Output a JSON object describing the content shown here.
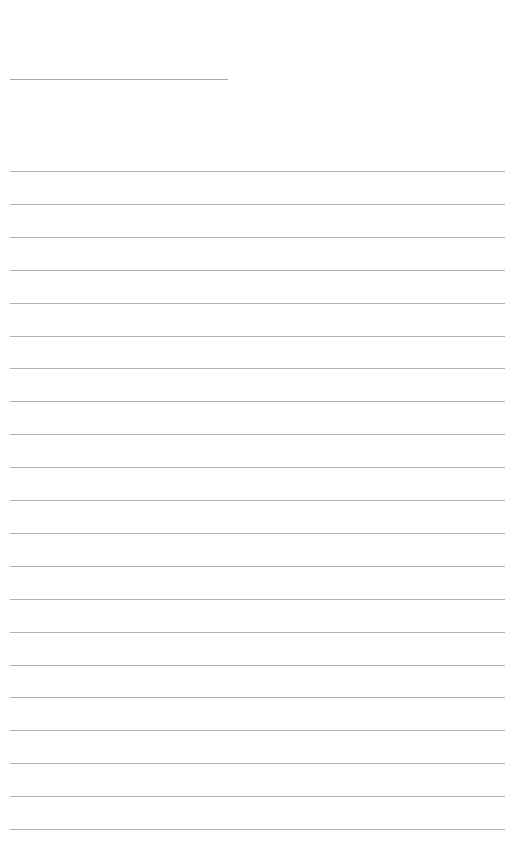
{
  "page": {
    "type": "lined-writing-sheet",
    "background_color": "#ffffff",
    "rule_color": "#b0b0b0",
    "title_line": {
      "text": "",
      "y": 79,
      "x_start": 10,
      "x_end": 228
    },
    "ruled_lines": {
      "count": 21,
      "first_y": 171,
      "spacing": 32.9,
      "x_start": 10,
      "x_end": 505,
      "texts": [
        "",
        "",
        "",
        "",
        "",
        "",
        "",
        "",
        "",
        "",
        "",
        "",
        "",
        "",
        "",
        "",
        "",
        "",
        "",
        "",
        ""
      ]
    }
  }
}
